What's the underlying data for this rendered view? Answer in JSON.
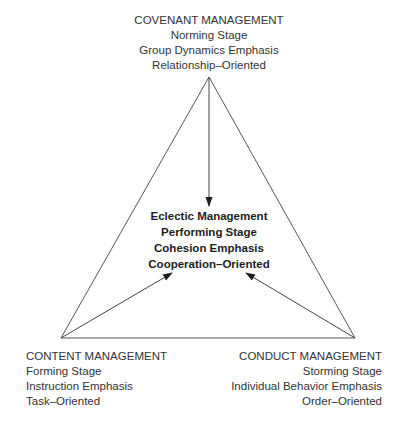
{
  "diagram": {
    "top_node": {
      "title": "COVENANT MANAGEMENT",
      "stage": "Norming Stage",
      "emphasis": "Group Dynamics Emphasis",
      "orientation": "Relationship–Oriented"
    },
    "center_node": {
      "title": "Eclectic Management",
      "stage": "Performing Stage",
      "emphasis": "Cohesion Emphasis",
      "orientation": "Cooperation–Oriented"
    },
    "left_node": {
      "title": "CONTENT MANAGEMENT",
      "stage": "Forming Stage",
      "emphasis": "Instruction Emphasis",
      "orientation": "Task–Oriented"
    },
    "right_node": {
      "title": "CONDUCT MANAGEMENT",
      "stage": "Storming Stage",
      "emphasis": "Individual Behavior Emphasis",
      "orientation": "Order–Oriented"
    },
    "colors": {
      "line": "#555555",
      "text": "#333333",
      "background": "#ffffff"
    }
  }
}
